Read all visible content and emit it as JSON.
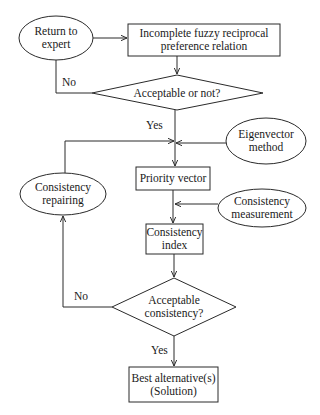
{
  "diagram": {
    "type": "flowchart",
    "stroke_color": "#2a2a2a",
    "background": "#ffffff",
    "nodes": {
      "return_to_expert": {
        "shape": "ellipse",
        "label": "Return to\nexpert"
      },
      "incomplete_relation": {
        "shape": "rectangle",
        "label": "Incomplete fuzzy reciprocal\npreference relation"
      },
      "acceptable_or_not": {
        "shape": "diamond",
        "label": "Acceptable or not?"
      },
      "eigenvector_method": {
        "shape": "ellipse",
        "label": "Eigenvector\nmethod"
      },
      "priority_vector": {
        "shape": "rectangle",
        "label": "Priority vector"
      },
      "consistency_repairing": {
        "shape": "ellipse",
        "label": "Consistency\nrepairing"
      },
      "consistency_measurement": {
        "shape": "ellipse",
        "label": "Consistency\nmeasurement"
      },
      "consistency_index": {
        "shape": "rectangle",
        "label": "Consistency\nindex"
      },
      "acceptable_consistency": {
        "shape": "diamond",
        "label": "Acceptable\nconsistency?"
      },
      "best_alternative": {
        "shape": "rectangle",
        "label": "Best alternative(s)\n(Solution)"
      }
    },
    "edge_labels": {
      "no_top": "No",
      "yes_top": "Yes",
      "no_bottom": "No",
      "yes_bottom": "Yes"
    },
    "edges": [
      {
        "from": "return_to_expert",
        "to": "incomplete_relation",
        "label": ""
      },
      {
        "from": "incomplete_relation",
        "to": "acceptable_or_not",
        "label": ""
      },
      {
        "from": "acceptable_or_not",
        "to": "return_to_expert",
        "label": "No"
      },
      {
        "from": "acceptable_or_not",
        "to": "priority_vector",
        "label": "Yes"
      },
      {
        "from": "eigenvector_method",
        "to": "priority_vector",
        "label": ""
      },
      {
        "from": "consistency_repairing",
        "to": "priority_vector",
        "label": ""
      },
      {
        "from": "priority_vector",
        "to": "consistency_index",
        "label": ""
      },
      {
        "from": "consistency_measurement",
        "to": "consistency_index",
        "label": ""
      },
      {
        "from": "consistency_index",
        "to": "acceptable_consistency",
        "label": ""
      },
      {
        "from": "acceptable_consistency",
        "to": "consistency_repairing",
        "label": "No"
      },
      {
        "from": "acceptable_consistency",
        "to": "best_alternative",
        "label": "Yes"
      }
    ]
  }
}
